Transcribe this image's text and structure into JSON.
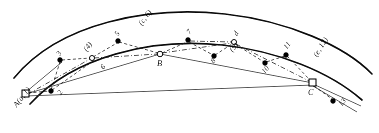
{
  "figure": {
    "caption": "",
    "anchors": [
      {
        "id": "A",
        "label": "A(a, 1)",
        "x": 24,
        "y": 94,
        "rotation": -52,
        "label_dx": -12,
        "label_dy": 8,
        "marker": "square"
      },
      {
        "id": "B",
        "label": "B",
        "x": 160,
        "y": 54,
        "rotation": 0,
        "label_dx": -2,
        "label_dy": 6,
        "marker": "open"
      },
      {
        "id": "C",
        "label": "C",
        "x": 313,
        "y": 83,
        "rotation": 0,
        "label_dx": -2,
        "label_dy": 7,
        "marker": "square"
      }
    ],
    "nodes": [
      {
        "id": "2",
        "label": "2",
        "x": 51,
        "y": 91,
        "marker": "filled",
        "label_dx": 3,
        "label_dy": 5,
        "rotation": -58
      },
      {
        "id": "3",
        "label": "3",
        "x": 60,
        "y": 60,
        "marker": "filled",
        "label_dx": -5,
        "label_dy": -4,
        "rotation": -58
      },
      {
        "id": "4",
        "label": "(4)",
        "x": 92,
        "y": 58,
        "marker": "open",
        "label_dx": -8,
        "label_dy": -11,
        "rotation": -52
      },
      {
        "id": "5",
        "label": "5",
        "x": 118,
        "y": 41,
        "marker": "filled",
        "label_dx": -6,
        "label_dy": -5,
        "rotation": -55
      },
      {
        "id": "6",
        "label": "6",
        "x": 101,
        "y": 68,
        "marker": "none",
        "label_dx": 0,
        "label_dy": 0,
        "rotation": -50
      },
      {
        "id": "c6",
        "label": "(c, 6)",
        "x": 143,
        "y": 30,
        "marker": "none",
        "label_dx": 0,
        "label_dy": 0,
        "rotation": -52
      },
      {
        "id": "7",
        "label": "7",
        "x": 188,
        "y": 40,
        "marker": "filled",
        "label_dx": -3,
        "label_dy": -6,
        "rotation": -52
      },
      {
        "id": "8",
        "label": "8",
        "x": 214,
        "y": 56,
        "marker": "filled",
        "label_dx": -5,
        "label_dy": 6,
        "rotation": -52
      },
      {
        "id": "9",
        "label": "(9)",
        "x": 236,
        "y": 55,
        "marker": "none",
        "label_dx": 0,
        "label_dy": 0,
        "rotation": -45
      },
      {
        "id": "d",
        "label": "d",
        "x": 234,
        "y": 42,
        "marker": "open",
        "label_dx": -1,
        "label_dy": -7,
        "rotation": -58
      },
      {
        "id": "10",
        "label": "10",
        "x": 265,
        "y": 63,
        "marker": "filled",
        "label_dx": -4,
        "label_dy": 8,
        "rotation": -48
      },
      {
        "id": "11",
        "label": "11",
        "x": 286,
        "y": 55,
        "marker": "filled",
        "label_dx": -3,
        "label_dy": -7,
        "rotation": -52
      },
      {
        "id": "e12",
        "label": "(e, 12)",
        "x": 320,
        "y": 63,
        "marker": "none",
        "label_dx": 0,
        "label_dy": 0,
        "rotation": -58
      },
      {
        "id": "13",
        "label": "13",
        "x": 333,
        "y": 101,
        "marker": "filled",
        "label_dx": 4,
        "label_dy": 4,
        "rotation": -52
      }
    ],
    "edge_labels": [
      {
        "text": "6",
        "x": 101,
        "y": 70,
        "rotation": -50
      }
    ],
    "corridor": {
      "outer_path": "M 14 78 C 60 22, 150 6, 225 14 C 288 21, 345 46, 372 74",
      "inner_path": "M 30 104 C 74 56, 152 38, 222 45 C 278 51, 330 72, 362 100"
    },
    "connector_paths": [
      {
        "id": "chord-A-B",
        "style": "solid",
        "d": "M 26 94 L 160 54"
      },
      {
        "id": "chord-B-C",
        "style": "solid",
        "d": "M 160 54 L 313 83"
      },
      {
        "id": "chord-A-C-low",
        "style": "solid",
        "d": "M 26 96 L 313 85"
      },
      {
        "id": "tail-C-1",
        "style": "solid",
        "d": "M 313 84 L 360 105"
      },
      {
        "id": "tail-C-2",
        "style": "solid",
        "d": "M 313 86 L 356 110"
      },
      {
        "id": "dash-A-2",
        "style": "dashed",
        "d": "M 26 93 L 51 91"
      },
      {
        "id": "dash-2-3",
        "style": "dashed",
        "d": "M 51 91 L 60 60"
      },
      {
        "id": "dash-3-4",
        "style": "dashed",
        "d": "M 60 60 L 92 58"
      },
      {
        "id": "dash-4-5",
        "style": "dashed",
        "d": "M 92 58 L 118 41"
      },
      {
        "id": "dash-5-B",
        "style": "dashed",
        "d": "M 118 41 L 160 54"
      },
      {
        "id": "dashdot-A-4",
        "style": "dashdot",
        "d": "M 26 94 L 92 58"
      },
      {
        "id": "dashdot-4-B",
        "style": "dashdot",
        "d": "M 92 58 L 160 54"
      },
      {
        "id": "dash-B-7",
        "style": "dashed",
        "d": "M 160 54 L 188 40"
      },
      {
        "id": "dash-7-8",
        "style": "dashed",
        "d": "M 188 40 L 214 56"
      },
      {
        "id": "dash-8-d",
        "style": "dashed",
        "d": "M 214 56 L 234 42"
      },
      {
        "id": "dashdot-B-d",
        "style": "dashdot",
        "d": "M 160 54 L 234 42"
      },
      {
        "id": "dash-d-10",
        "style": "dashed",
        "d": "M 234 42 L 265 63"
      },
      {
        "id": "dash-10-11",
        "style": "dashed",
        "d": "M 265 63 L 286 55"
      },
      {
        "id": "dash-11-C",
        "style": "dashed",
        "d": "M 286 55 L 313 83"
      },
      {
        "id": "dashdot-d-C",
        "style": "dashdot",
        "d": "M 234 42 L 313 83"
      },
      {
        "id": "dash-C-13",
        "style": "dashed",
        "d": "M 313 84 L 333 101"
      },
      {
        "id": "cross-A-3",
        "style": "dashed",
        "d": "M 26 96 L 62 62"
      },
      {
        "id": "cross-2-B",
        "style": "dashed",
        "d": "M 51 92 L 95 60"
      }
    ]
  }
}
